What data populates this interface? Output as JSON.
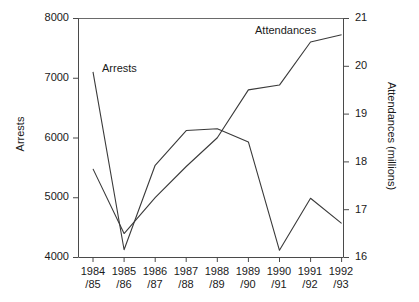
{
  "chart_data": {
    "type": "line",
    "title": "",
    "subtitle": "",
    "categories": [
      "1984/85",
      "1985/86",
      "1986/87",
      "1987/88",
      "1988/89",
      "1989/90",
      "1990/91",
      "1991/92",
      "1992/93"
    ],
    "category_lines": [
      [
        "1984",
        "/85"
      ],
      [
        "1985",
        "/86"
      ],
      [
        "1986",
        "/87"
      ],
      [
        "1987",
        "/88"
      ],
      [
        "1988",
        "/89"
      ],
      [
        "1989",
        "/90"
      ],
      [
        "1990",
        "/91"
      ],
      [
        "1991",
        "/92"
      ],
      [
        "1992",
        "/93"
      ]
    ],
    "xlabel": "",
    "ylabel": "Arrests",
    "y2label": "Attendances (millions)",
    "ylim": [
      4000,
      8000
    ],
    "y2lim": [
      16,
      21
    ],
    "yticks": [
      4000,
      5000,
      6000,
      7000,
      8000
    ],
    "y2ticks": [
      16,
      17,
      18,
      19,
      20,
      21
    ],
    "ytick_labels": [
      "4000",
      "5000",
      "6000",
      "7000",
      "8000"
    ],
    "y2tick_labels": [
      "16",
      "17",
      "18",
      "19",
      "20",
      "21"
    ],
    "grid": false,
    "legend_position": "inline-annotations",
    "series": [
      {
        "name": "Arrests",
        "axis": "left",
        "color": "#3a3a3a",
        "values": [
          7100,
          4130,
          5540,
          6120,
          6150,
          5930,
          4120,
          4990,
          4570
        ]
      },
      {
        "name": "Attendances",
        "axis": "right",
        "color": "#3a3a3a",
        "values": [
          17.85,
          16.5,
          17.25,
          17.9,
          18.5,
          19.5,
          19.6,
          20.5,
          20.65
        ]
      }
    ],
    "annotations": [
      {
        "text": "Arrests",
        "series": "Arrests"
      },
      {
        "text": "Attendances",
        "series": "Attendances"
      }
    ]
  }
}
